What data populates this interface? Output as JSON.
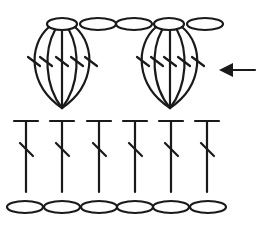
{
  "diagram": {
    "type": "crochet-stitch-chart",
    "stroke_color": "#1a1a1a",
    "background": "#ffffff",
    "rows": [
      {
        "name": "foundation-chain",
        "stitch": "chain",
        "count": 6
      },
      {
        "name": "double-crochet-row",
        "stitch": "double-crochet",
        "count": 6
      },
      {
        "name": "cluster-row",
        "stitches": [
          "cluster-5dc",
          "chain",
          "chain",
          "cluster-5dc",
          "chain"
        ],
        "cluster_count": 2,
        "strands_per_cluster": 5,
        "chains_between_clusters": 2
      }
    ],
    "row_indicator": {
      "icon": "arrow-left-icon",
      "points_to": "cluster-row"
    }
  }
}
